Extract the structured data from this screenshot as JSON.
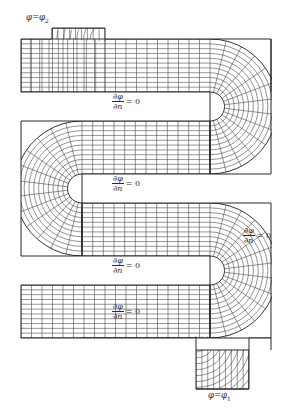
{
  "figure": {
    "kind": "serpentine-channel-curvilinear-mesh",
    "caption_text": "",
    "colors": {
      "mesh_line": "#3b3b3b",
      "boundary_line": "#1c1c1c",
      "frame_rule": "#8d8d8d",
      "text": "#2c2c2c",
      "background": "#ffffff"
    },
    "labels": {
      "inlet": {
        "symbol": "φ",
        "equals": "=",
        "value_symbol": "φ",
        "value_index": "2",
        "full": "φ = φ₂"
      },
      "outlet": {
        "symbol": "φ",
        "equals": "=",
        "value_symbol": "φ",
        "value_index": "1",
        "full": "φ = φ₁"
      },
      "neumann": {
        "numerator": "∂φ",
        "denominator": "∂n",
        "equals": "= 0",
        "full": "∂φ/∂n = 0"
      }
    },
    "boundary_conditions": [
      {
        "id": "bc-inlet",
        "type": "Dirichlet",
        "text": "φ = φ₂",
        "position": "top-left-stub"
      },
      {
        "id": "bc-wall-1",
        "type": "Neumann",
        "text": "∂φ/∂n = 0",
        "position": "slot-1-upper-wall"
      },
      {
        "id": "bc-wall-2",
        "type": "Neumann",
        "text": "∂φ/∂n = 0",
        "position": "slot-2-upper-wall"
      },
      {
        "id": "bc-wall-3",
        "type": "Neumann",
        "text": "∂φ/∂n = 0",
        "position": "slot-3-upper-wall"
      },
      {
        "id": "bc-wall-4",
        "type": "Neumann",
        "text": "∂φ/∂n = 0",
        "position": "slot-4-upper-wall"
      },
      {
        "id": "bc-wall-right",
        "type": "Neumann",
        "text": "∂φ/∂n = 0",
        "position": "right-outer-wall"
      },
      {
        "id": "bc-outlet",
        "type": "Dirichlet",
        "text": "φ = φ₁",
        "position": "bottom-right-stub"
      }
    ],
    "geometry": {
      "arm_count": 4,
      "slot_count": 4,
      "bend_count": 3,
      "outer_left_x": 21,
      "outer_right_x": 271,
      "arm_rows": [
        {
          "top": 39,
          "bottom": 92
        },
        {
          "top": 121,
          "bottom": 174
        },
        {
          "top": 203,
          "bottom": 256
        },
        {
          "top": 285,
          "bottom": 338
        },
        {
          "top": 350,
          "bottom": 385
        }
      ],
      "slot_rows": [
        {
          "top": 92,
          "bottom": 121,
          "open_side": "left"
        },
        {
          "top": 174,
          "bottom": 203,
          "open_side": "right"
        },
        {
          "top": 256,
          "bottom": 285,
          "open_side": "left"
        },
        {
          "top": 338,
          "bottom": 350,
          "open_side": "right"
        }
      ],
      "stubs": [
        {
          "id": "inlet-stub",
          "x0": 52,
          "x1": 105,
          "y0": 28,
          "y1": 39
        },
        {
          "id": "outlet-stub",
          "x0": 196,
          "x1": 249,
          "y0": 375,
          "y1": 389
        }
      ]
    },
    "label_positions": [
      {
        "id": "label-inlet",
        "x": 24,
        "y": 14,
        "kind": "dirichlet",
        "source": "inlet"
      },
      {
        "id": "label-neu-1",
        "x": 100,
        "y": 95,
        "kind": "neumann"
      },
      {
        "id": "label-neu-2",
        "x": 100,
        "y": 177,
        "kind": "neumann"
      },
      {
        "id": "label-neu-3",
        "x": 100,
        "y": 259,
        "kind": "neumann"
      },
      {
        "id": "label-neu-4",
        "x": 100,
        "y": 305,
        "kind": "neumann"
      },
      {
        "id": "label-neu-right",
        "x": 240,
        "y": 229,
        "kind": "neumann"
      },
      {
        "id": "label-outlet",
        "x": 208,
        "y": 392,
        "kind": "dirichlet",
        "source": "outlet"
      }
    ]
  }
}
